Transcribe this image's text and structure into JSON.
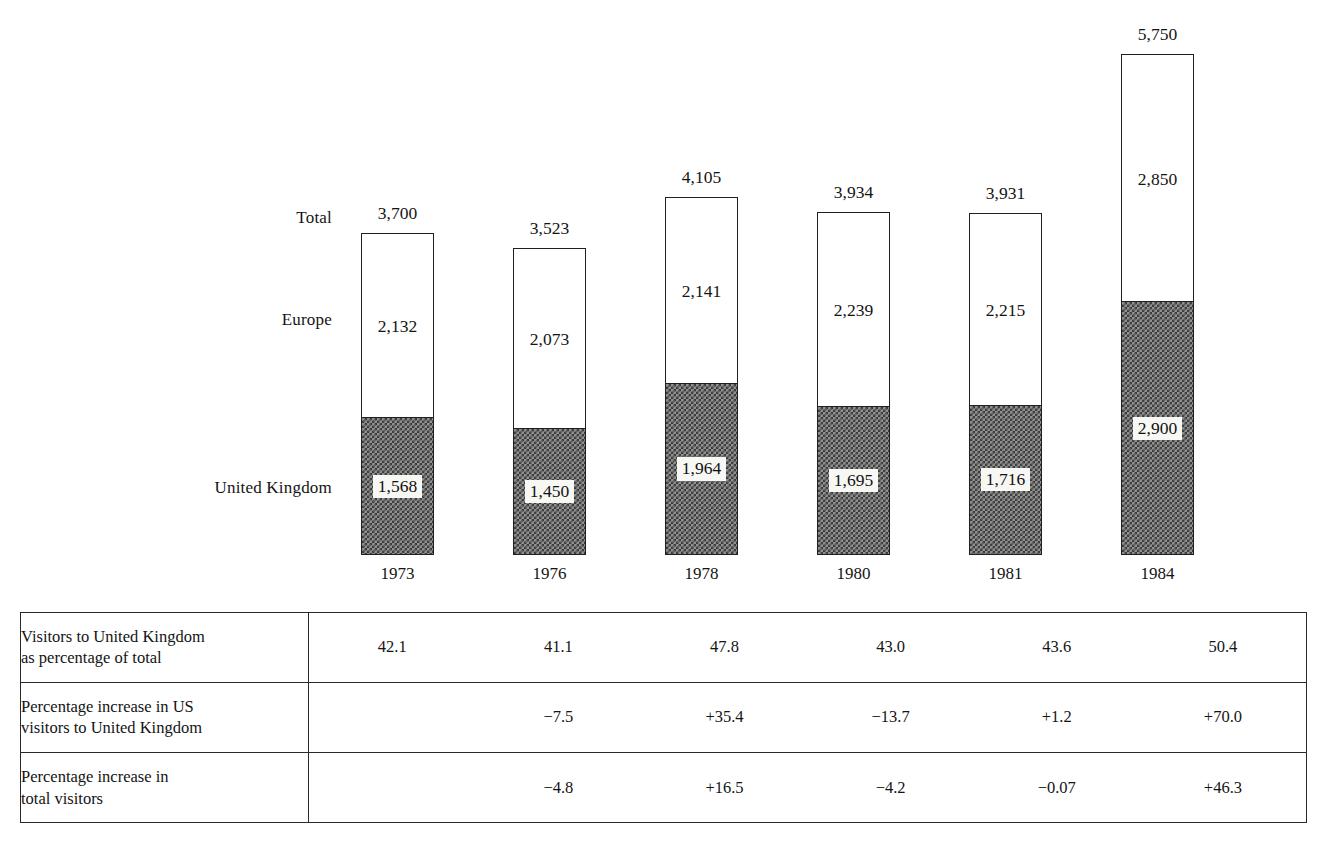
{
  "chart_data": {
    "type": "bar",
    "subtype": "stacked-bar",
    "title": "",
    "xlabel": "",
    "ylabel": "",
    "categories": [
      "1973",
      "1976",
      "1978",
      "1980",
      "1981",
      "1984"
    ],
    "series": [
      {
        "name": "United Kingdom",
        "values": [
          1568,
          1450,
          1964,
          1695,
          1716,
          2900
        ]
      },
      {
        "name": "Europe",
        "values": [
          2132,
          2073,
          2141,
          2239,
          2215,
          2850
        ]
      }
    ],
    "totals": [
      3700,
      3523,
      4105,
      3934,
      3931,
      5750
    ],
    "total_labels": [
      "3,700",
      "3,523",
      "4,105",
      "3,934",
      "3,931",
      "5,750"
    ],
    "europe_labels": [
      "2,132",
      "2,073",
      "2,141",
      "2,239",
      "2,215",
      "2,850"
    ],
    "uk_labels": [
      "1,568",
      "1,450",
      "1,964",
      "1,695",
      "1,716",
      "2,900"
    ],
    "row_labels": {
      "total": "Total",
      "europe": "Europe",
      "uk": "United Kingdom"
    },
    "ylim": [
      0,
      5750
    ],
    "grid": false,
    "legend_position": "left-axis-labels"
  },
  "table": {
    "rows": [
      {
        "header_lines": [
          "Visitors to United Kingdom",
          "as percentage of total"
        ],
        "values": [
          "42.1",
          "41.1",
          "47.8",
          "43.0",
          "43.6",
          "50.4"
        ]
      },
      {
        "header_lines": [
          "Percentage increase in US",
          "visitors to United Kingdom"
        ],
        "values": [
          "",
          "−7.5",
          "+35.4",
          "−13.7",
          "+1.2",
          "+70.0"
        ]
      },
      {
        "header_lines": [
          "Percentage increase in",
          "total visitors"
        ],
        "values": [
          "",
          "−4.8",
          "+16.5",
          "−4.2",
          "−0.07",
          "+46.3"
        ]
      }
    ]
  },
  "colors": {
    "ink": "#1a1a1a",
    "border": "#20201f",
    "uk_fill_dark": "#3a3a3a",
    "uk_fill_light": "#8f8f8f",
    "europe_fill": "#ffffff",
    "page_background": "#ffffff"
  }
}
